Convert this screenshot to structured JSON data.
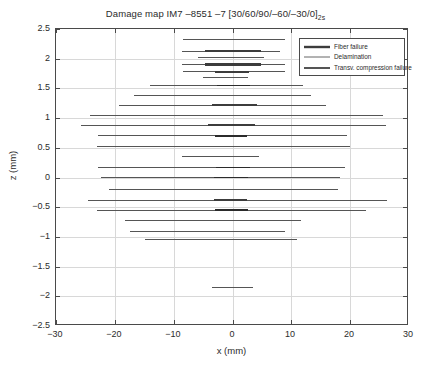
{
  "chart_data": {
    "type": "line",
    "title": "Damage map IM7 –8551 –7 [30/60/90/–60/–30/0]",
    "title_subscript": "2s",
    "xlabel": "x (mm)",
    "ylabel": "z (mm)",
    "xlim": [
      -30,
      30
    ],
    "ylim": [
      -2.5,
      2.5
    ],
    "xticks": [
      -30,
      -20,
      -10,
      0,
      10,
      20,
      30
    ],
    "yticks": [
      2.5,
      2,
      1.5,
      1,
      0.5,
      0,
      -0.5,
      -1,
      -1.5,
      -2,
      -2.5
    ],
    "xtick_labels": [
      "−30",
      "−20",
      "−10",
      "0",
      "10",
      "20",
      "30"
    ],
    "ytick_labels": [
      "2.5",
      "2",
      "1.5",
      "1",
      "0.5",
      "0",
      "−0.5",
      "−1",
      "−1.5",
      "−2",
      "−2.5"
    ],
    "grid": true,
    "legend_position": "top-right",
    "legend": [
      {
        "name": "Fiber failure",
        "color": "#3c3c3c",
        "width": 2.4
      },
      {
        "name": "Delamination",
        "color": "#555555",
        "width": 0.9
      },
      {
        "name": "Transv. compression failure",
        "color": "#2b2b2b",
        "width": 1.6
      }
    ],
    "series": [
      {
        "name": "Delamination",
        "segments": [
          {
            "z": 2.32,
            "x0": -8.4,
            "x1": 9.0
          },
          {
            "z": 2.13,
            "x0": -8.6,
            "x1": 8.0
          },
          {
            "z": 2.02,
            "x0": -5.9,
            "x1": 5.4
          },
          {
            "z": 1.9,
            "x0": -8.6,
            "x1": 9.0
          },
          {
            "z": 1.78,
            "x0": -8.4,
            "x1": 9.0
          },
          {
            "z": 1.68,
            "x0": -5.0,
            "x1": 2.6
          },
          {
            "z": 1.55,
            "x0": -14.0,
            "x1": 11.9
          },
          {
            "z": 1.38,
            "x0": -16.7,
            "x1": 13.3
          },
          {
            "z": 1.22,
            "x0": -19.3,
            "x1": 15.9
          },
          {
            "z": 1.05,
            "x0": -24.2,
            "x1": 25.5
          },
          {
            "z": 0.88,
            "x0": -25.8,
            "x1": 26.1
          },
          {
            "z": 0.7,
            "x0": -22.8,
            "x1": 19.5
          },
          {
            "z": 0.52,
            "x0": -23.1,
            "x1": 19.9
          },
          {
            "z": 0.35,
            "x0": -8.6,
            "x1": 4.5
          },
          {
            "z": 0.17,
            "x0": -22.8,
            "x1": 19.1
          },
          {
            "z": 0.0,
            "x0": -22.3,
            "x1": 18.3
          },
          {
            "z": -0.2,
            "x0": -21.0,
            "x1": 17.9
          },
          {
            "z": -0.38,
            "x0": -24.5,
            "x1": 26.3
          },
          {
            "z": -0.55,
            "x0": -23.0,
            "x1": 22.7
          },
          {
            "z": -0.72,
            "x0": -18.3,
            "x1": 11.6
          },
          {
            "z": -0.9,
            "x0": -17.4,
            "x1": 9.0
          },
          {
            "z": -1.05,
            "x0": -14.9,
            "x1": 10.9
          },
          {
            "z": -1.85,
            "x0": -3.5,
            "x1": 3.4
          }
        ]
      },
      {
        "name": "Fiber failure",
        "segments": [
          {
            "z": 2.13,
            "x0": -4.6,
            "x1": 4.8
          },
          {
            "z": 1.9,
            "x0": -4.7,
            "x1": 4.9
          },
          {
            "z": 1.78,
            "x0": -3.0,
            "x1": 2.8
          },
          {
            "z": 1.22,
            "x0": -3.5,
            "x1": 4.2
          },
          {
            "z": 0.88,
            "x0": -4.1,
            "x1": 3.8
          },
          {
            "z": -0.38,
            "x0": -3.2,
            "x1": 2.5
          }
        ]
      },
      {
        "name": "Transv. compression failure",
        "segments": [
          {
            "z": 1.55,
            "x0": -2.6,
            "x1": 3.0
          },
          {
            "z": 0.7,
            "x0": -3.0,
            "x1": 2.5
          },
          {
            "z": 0.17,
            "x0": -2.8,
            "x1": 2.9
          },
          {
            "z": 0.0,
            "x0": -3.1,
            "x1": 2.6
          },
          {
            "z": -0.55,
            "x0": -3.0,
            "x1": 2.7
          }
        ]
      }
    ]
  }
}
